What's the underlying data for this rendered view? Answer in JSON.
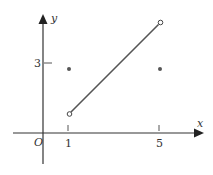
{
  "diagram": {
    "type": "function-graph",
    "axes": {
      "x_label": "x",
      "y_label": "y",
      "origin_label": "O",
      "x_ticks": [
        {
          "value": 1,
          "label": "1"
        },
        {
          "value": 5,
          "label": "5"
        }
      ],
      "y_ticks": [
        {
          "value": 3,
          "label": "3"
        }
      ]
    },
    "segment": {
      "from": {
        "x": 1,
        "y": 0.75,
        "open": true
      },
      "to": {
        "x": 5,
        "y": 4.75,
        "open": true
      }
    },
    "points": [
      {
        "x": 1,
        "y": 2.75,
        "filled": true
      },
      {
        "x": 5,
        "y": 2.75,
        "filled": true
      }
    ],
    "colors": {
      "axis": "#333333",
      "line": "#555555",
      "point": "#555555"
    }
  }
}
